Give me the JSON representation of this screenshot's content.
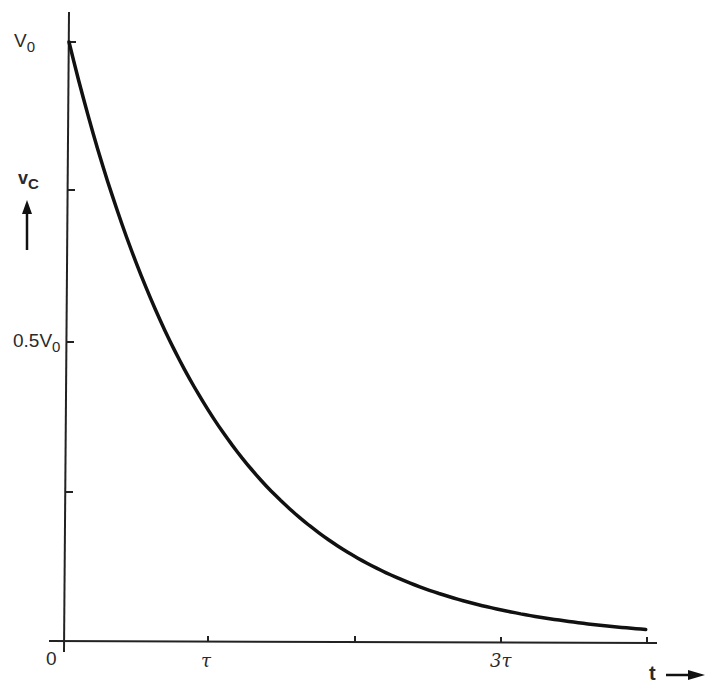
{
  "chart_data": {
    "type": "line",
    "title": "",
    "xlabel": "t",
    "ylabel": "vC",
    "x_tick_labels": [
      "0",
      "τ",
      "",
      "3τ",
      ""
    ],
    "x_ticks_in_tau": [
      0,
      1,
      2,
      3,
      4
    ],
    "y_tick_labels": [
      "V0",
      "",
      "0.5V0",
      "",
      "0"
    ],
    "y_ticks_in_V0": [
      1.0,
      0.75,
      0.5,
      0.25,
      0
    ],
    "series": [
      {
        "name": "vC = V0 e^(-t/τ)",
        "x_in_tau": [
          0,
          0.25,
          0.5,
          0.75,
          1,
          1.5,
          2,
          2.5,
          3,
          3.5,
          3.95
        ],
        "y_in_V0": [
          1.0,
          0.779,
          0.607,
          0.472,
          0.368,
          0.223,
          0.135,
          0.082,
          0.05,
          0.03,
          0.019
        ]
      }
    ],
    "xlim": [
      0,
      4
    ],
    "ylim": [
      0,
      1
    ],
    "grid": false,
    "legend": "none"
  },
  "labels": {
    "y_top": "V",
    "y_top_sub": "0",
    "y_half": "0.5V",
    "y_half_sub": "0",
    "axis_y": "v",
    "axis_y_sub": "C",
    "origin": "0",
    "tau1": "τ",
    "tau3": "3τ",
    "axis_x": "t"
  }
}
